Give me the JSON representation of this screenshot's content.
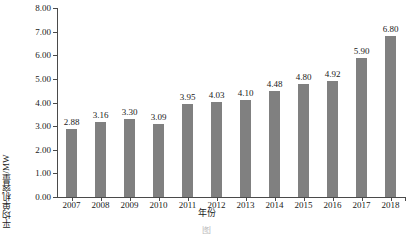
{
  "chart_data": {
    "type": "bar",
    "title": "",
    "xlabel": "年份",
    "ylabel": "平均单机容量/MW",
    "categories": [
      "2007",
      "2008",
      "2009",
      "2010",
      "2011",
      "2012",
      "2013",
      "2014",
      "2015",
      "2016",
      "2017",
      "2018"
    ],
    "values": [
      2.88,
      3.16,
      3.3,
      3.09,
      3.95,
      4.03,
      4.1,
      4.48,
      4.8,
      4.92,
      5.9,
      6.8
    ],
    "value_labels": [
      "2.88",
      "3.16",
      "3.30",
      "3.09",
      "3.95",
      "4.03",
      "4.10",
      "4.48",
      "4.80",
      "4.92",
      "5.90",
      "6.80"
    ],
    "ylim": [
      0,
      8
    ],
    "ytick_labels": [
      "0.00",
      "1.00",
      "2.00",
      "3.00",
      "4.00",
      "5.00",
      "6.00",
      "7.00",
      "8.00"
    ],
    "ytick_values": [
      0,
      1,
      2,
      3,
      4,
      5,
      6,
      7,
      8
    ],
    "grid": false,
    "legend": false,
    "series_color": "#808080",
    "axis_color": "#4a4a4a",
    "text_color": "#1a1a1a"
  },
  "caption": {
    "text": "图"
  }
}
